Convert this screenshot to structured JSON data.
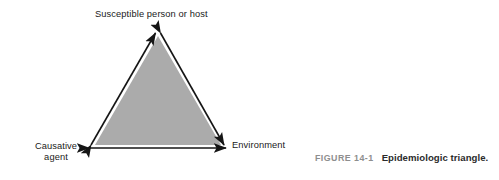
{
  "figure": {
    "background_color": "#ffffff",
    "caption": {
      "number": "FIGURE 14-1",
      "text": "Epidemiologic triangle.",
      "number_color": "#8e8e8e",
      "text_color": "#2b2b2b"
    },
    "diagram": {
      "type": "epidemiologic-triangle",
      "fill_color": "#ababab",
      "outline_color": "#1a1a1a",
      "vertices": [
        {
          "id": "host",
          "label": "Susceptible person or host",
          "position": "top",
          "x": 158,
          "y": 28
        },
        {
          "id": "agent",
          "label": "Causative agent",
          "label_lines": [
            "Causative",
            "agent"
          ],
          "position": "bottom-left",
          "x": 86,
          "y": 148
        },
        {
          "id": "environment",
          "label": "Environment",
          "position": "bottom-right",
          "x": 227,
          "y": 148
        }
      ],
      "edges": [
        {
          "from": "agent",
          "to": "host",
          "arrowheads": "double"
        },
        {
          "from": "host",
          "to": "environment",
          "arrowheads": "double"
        },
        {
          "from": "agent",
          "to": "environment",
          "arrowheads": "double"
        }
      ]
    }
  }
}
